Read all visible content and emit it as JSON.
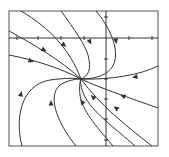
{
  "diagram": {
    "type": "phase-portrait",
    "frame": {
      "x": 9,
      "y": 11,
      "w": 149,
      "h": 135
    },
    "axes": {
      "x_axis_y": 38,
      "y_axis_x": 106,
      "x_ticks": [
        17,
        38,
        61,
        84,
        129,
        152
      ],
      "y_ticks": [
        17,
        59,
        79,
        99,
        119,
        140
      ]
    },
    "colors": {
      "line": "#333333",
      "frame": "#555555",
      "background": "#ffffff"
    },
    "node": {
      "x": 81,
      "y": 79
    },
    "trajectories": [
      {
        "d": "M21,11 C50,28 70,50 81,79",
        "arrow": {
          "x": 64,
          "y": 45,
          "angle": 40
        }
      },
      {
        "d": "M61,11 C75,30 85,45 88,55 C92,70 88,76 81,79",
        "arrow": {
          "x": 90,
          "y": 42,
          "angle": 60
        }
      },
      {
        "d": "M96,11 C108,25 118,45 115,60 C112,75 95,79 81,79",
        "arrow": {
          "x": 116,
          "y": 41,
          "angle": 80
        }
      },
      {
        "d": "M9,31 C35,45 60,60 81,79",
        "arrow": {
          "x": 44,
          "y": 50,
          "angle": 30
        }
      },
      {
        "d": "M9,55 C35,60 60,68 81,79",
        "arrow": {
          "x": 31,
          "y": 61,
          "angle": 18
        }
      },
      {
        "d": "M158,66 C140,75 110,80 81,79",
        "arrow": {
          "x": 135,
          "y": 77,
          "angle": 170
        }
      },
      {
        "d": "M22,146 C15,120 20,85 50,80 C65,78 75,78 81,79",
        "arrow": {
          "x": 21,
          "y": 94,
          "angle": -75
        }
      },
      {
        "d": "M76,146 C55,120 48,95 60,85 C68,80 76,79 81,79",
        "arrow": {
          "x": 51,
          "y": 103,
          "angle": -90
        }
      },
      {
        "d": "M113,146 C95,125 82,110 80,95 C79,86 80,81 81,79",
        "arrow": {
          "x": 82,
          "y": 102,
          "angle": -125
        }
      },
      {
        "d": "M135,146 C115,128 92,112 84,95 C81,88 80,82 81,79",
        "arrow": {
          "x": 93,
          "y": 97,
          "angle": -135
        }
      },
      {
        "d": "M152,146 C125,125 100,105 81,79",
        "arrow": {
          "x": 116,
          "y": 108,
          "angle": -145
        }
      },
      {
        "d": "M158,108 C130,98 100,88 81,79",
        "arrow": {
          "x": 123,
          "y": 96,
          "angle": -155
        }
      }
    ]
  }
}
